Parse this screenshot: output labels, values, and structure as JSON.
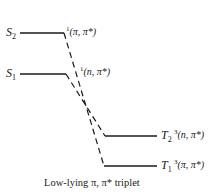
{
  "diagram": {
    "type": "energy-level-diagram",
    "levels": [
      {
        "id": "S2",
        "state": "S",
        "index": "2",
        "multiplicity": "1",
        "configuration": "(π, π*)"
      },
      {
        "id": "S1",
        "state": "S",
        "index": "1",
        "multiplicity": "1",
        "configuration": "(n, π*)"
      },
      {
        "id": "T2",
        "state": "T",
        "index": "2",
        "multiplicity": "3",
        "configuration": "(n, π*)"
      },
      {
        "id": "T1",
        "state": "T",
        "index": "1",
        "multiplicity": "3",
        "configuration": "(π, π*)"
      }
    ],
    "connections": [
      {
        "from": "S2",
        "to": "T1",
        "style": "dashed"
      },
      {
        "from": "S1",
        "to": "T2",
        "style": "dashed"
      }
    ],
    "caption": "Low-lying π, π* triplet",
    "line_color": "#1a1a1a"
  }
}
